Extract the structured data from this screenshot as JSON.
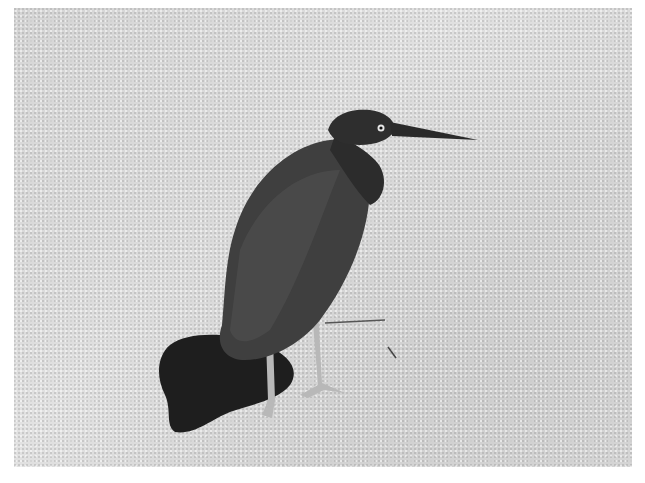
{
  "image": {
    "subject": "dark heron standing on sand",
    "scene": "sandy beach with bird shadow",
    "colors": {
      "background": "#ffffff",
      "sand": "#d8d8d8",
      "bird": "#3a3a3a",
      "shadow": "#1e1e1e",
      "legs": "#b5b5b5"
    }
  }
}
